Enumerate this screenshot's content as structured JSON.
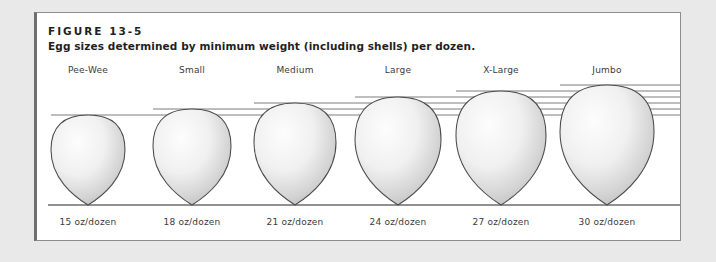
{
  "figure": {
    "title": "FIGURE 13-5",
    "caption": "Egg sizes determined by minimum weight (including shells) per dozen."
  },
  "chart_data": {
    "type": "bar",
    "title": "Egg sizes determined by minimum weight (including shells) per dozen.",
    "xlabel": "",
    "ylabel": "",
    "categories": [
      "Pee-Wee",
      "Small",
      "Medium",
      "Large",
      "X-Large",
      "Jumbo"
    ],
    "values": [
      15,
      18,
      21,
      24,
      27,
      30
    ],
    "value_labels": [
      "15 oz/dozen",
      "18 oz/dozen",
      "21 oz/dozen",
      "24 oz/dozen",
      "27 oz/dozen",
      "30 oz/dozen"
    ],
    "unit": "oz/dozen",
    "grid": false,
    "legend": "none",
    "eggs": [
      {
        "category": "Pee-Wee",
        "weight_oz_per_dozen": 15,
        "weight_label": "15 oz/dozen",
        "cx": 51,
        "bottom": 192,
        "rx": 37,
        "ry": 45
      },
      {
        "category": "Small",
        "weight_oz_per_dozen": 18,
        "weight_label": "18 oz/dozen",
        "cx": 155,
        "bottom": 192,
        "rx": 39,
        "ry": 48
      },
      {
        "category": "Medium",
        "weight_oz_per_dozen": 21,
        "weight_label": "21 oz/dozen",
        "cx": 258,
        "bottom": 192,
        "rx": 41,
        "ry": 51
      },
      {
        "category": "Large",
        "weight_oz_per_dozen": 24,
        "weight_label": "24 oz/dozen",
        "cx": 361,
        "bottom": 192,
        "rx": 43,
        "ry": 54
      },
      {
        "category": "X-Large",
        "weight_oz_per_dozen": 27,
        "weight_label": "27 oz/dozen",
        "cx": 464,
        "bottom": 192,
        "rx": 45,
        "ry": 57
      },
      {
        "category": "Jumbo",
        "weight_oz_per_dozen": 30,
        "weight_label": "30 oz/dozen",
        "cx": 570,
        "bottom": 192,
        "rx": 47,
        "ry": 60
      }
    ],
    "baseline_y": 192,
    "colors": {
      "page_background": "#e9e9e9",
      "panel_background": "#ffffff",
      "panel_border": "#8c8c8c",
      "panel_accent_border": "#6e6e6e",
      "text": "#1f1f1f",
      "label_text": "#3b3b3b",
      "egg_outline": "#4a4a4a",
      "egg_fill_light": "#fdfdfd",
      "egg_fill_dark": "#a9a9a9",
      "guide_line": "#6d6d6d",
      "baseline": "#6d6d6d"
    }
  }
}
